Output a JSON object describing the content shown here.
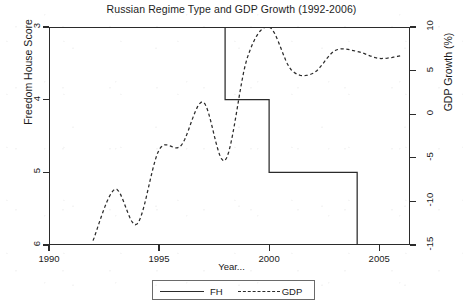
{
  "chart_data": {
    "type": "line",
    "title": "Russian Regime Type and GDP Growth (1992-2006)",
    "xlabel": "Year...",
    "ylabel": "Freedom House Score",
    "ylabel_right": "GDP Growth (%)",
    "grid": false,
    "legend_position": "bottom-center",
    "xlim": [
      1990,
      2006.4
    ],
    "ylim_left": [
      6,
      3
    ],
    "ylim_right": [
      -15,
      10
    ],
    "y_inverted_left": true,
    "xticks": [
      1990,
      1995,
      2000,
      2005
    ],
    "xticklabels": [
      "1990",
      "1995",
      "2000",
      "2005"
    ],
    "yticks_left": [
      3,
      4,
      5,
      6
    ],
    "yticklabels_left": [
      "3",
      "4",
      "5",
      "6"
    ],
    "yticks_right": [
      10,
      5,
      0,
      -5,
      -10,
      -15
    ],
    "yticklabels_right": [
      "10",
      "5",
      "0",
      "-5",
      "-10",
      "-15"
    ],
    "x": [
      1992,
      1993,
      1994,
      1995,
      1996,
      1997,
      1998,
      1999,
      2000,
      2001,
      2002,
      2003,
      2004,
      2005,
      2006
    ],
    "series": [
      {
        "name": "FH",
        "axis": "left",
        "style": "solid",
        "color": "#2b2b2b",
        "values": [
          3,
          3,
          3,
          3,
          3,
          3,
          4,
          4,
          5,
          5,
          5,
          5,
          6,
          6,
          6
        ]
      },
      {
        "name": "GDP",
        "axis": "right",
        "style": "dashed",
        "color": "#2b2b2b",
        "values": [
          -14.5,
          -8.6,
          -12.6,
          -4.1,
          -3.6,
          1.4,
          -5.3,
          6.4,
          10.0,
          5.1,
          4.7,
          7.3,
          7.2,
          6.4,
          6.7
        ]
      }
    ],
    "legend": [
      {
        "label": "FH",
        "style": "solid"
      },
      {
        "label": "GDP",
        "style": "dashed"
      }
    ]
  }
}
